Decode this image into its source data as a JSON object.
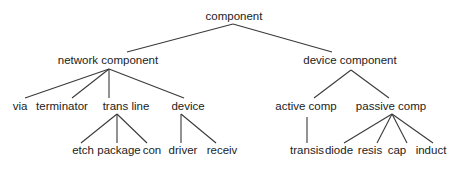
{
  "diagram": {
    "type": "tree",
    "root": "component",
    "nodes": [
      {
        "id": "component",
        "label": "component",
        "x": 234,
        "y": 20
      },
      {
        "id": "network_component",
        "label": "network component",
        "x": 108,
        "y": 64,
        "parent": "component"
      },
      {
        "id": "device_component",
        "label": "device component",
        "x": 350,
        "y": 64,
        "parent": "component"
      },
      {
        "id": "via",
        "label": "via",
        "x": 20,
        "y": 110,
        "parent": "network_component"
      },
      {
        "id": "terminator",
        "label": "terminator",
        "x": 62,
        "y": 110,
        "parent": "network_component"
      },
      {
        "id": "trans_line",
        "label": "trans line",
        "x": 126,
        "y": 110,
        "parent": "network_component"
      },
      {
        "id": "device",
        "label": "device",
        "x": 188,
        "y": 110,
        "parent": "network_component"
      },
      {
        "id": "etch",
        "label": "etch",
        "x": 83,
        "y": 154,
        "parent": "trans_line"
      },
      {
        "id": "package",
        "label": "package",
        "x": 119,
        "y": 154,
        "parent": "trans_line"
      },
      {
        "id": "con",
        "label": "con",
        "x": 152,
        "y": 154,
        "parent": "trans_line"
      },
      {
        "id": "driver",
        "label": "driver",
        "x": 183,
        "y": 154,
        "parent": "device"
      },
      {
        "id": "receiv",
        "label": "receiv",
        "x": 222,
        "y": 154,
        "parent": "device"
      },
      {
        "id": "active_comp",
        "label": "active comp",
        "x": 306,
        "y": 110,
        "parent": "device_component"
      },
      {
        "id": "passive_comp",
        "label": "passive comp",
        "x": 391,
        "y": 110,
        "parent": "device_component"
      },
      {
        "id": "transis",
        "label": "transis",
        "x": 307,
        "y": 154,
        "parent": "active_comp"
      },
      {
        "id": "diode",
        "label": "diode",
        "x": 339,
        "y": 154,
        "parent": "passive_comp"
      },
      {
        "id": "resis",
        "label": "resis",
        "x": 370,
        "y": 154,
        "parent": "passive_comp"
      },
      {
        "id": "cap",
        "label": "cap",
        "x": 397,
        "y": 154,
        "parent": "passive_comp"
      },
      {
        "id": "induct",
        "label": "induct",
        "x": 431,
        "y": 154,
        "parent": "passive_comp"
      }
    ],
    "edges": [
      {
        "from": "component",
        "to": "network_component",
        "x1": 233,
        "y1": 24,
        "x2": 127,
        "y2": 52
      },
      {
        "from": "component",
        "to": "device_component",
        "x1": 233,
        "y1": 24,
        "x2": 332,
        "y2": 52
      },
      {
        "from": "network_component",
        "to": "via",
        "x1": 109,
        "y1": 69,
        "x2": 25,
        "y2": 98
      },
      {
        "from": "network_component",
        "to": "terminator",
        "x1": 109,
        "y1": 69,
        "x2": 72,
        "y2": 98
      },
      {
        "from": "network_component",
        "to": "trans_line",
        "x1": 109,
        "y1": 69,
        "x2": 109,
        "y2": 98
      },
      {
        "from": "network_component",
        "to": "device",
        "x1": 109,
        "y1": 69,
        "x2": 184,
        "y2": 98
      },
      {
        "from": "trans_line",
        "to": "etch",
        "x1": 117,
        "y1": 114,
        "x2": 81,
        "y2": 143
      },
      {
        "from": "trans_line",
        "to": "package",
        "x1": 117,
        "y1": 114,
        "x2": 117,
        "y2": 143
      },
      {
        "from": "trans_line",
        "to": "con",
        "x1": 117,
        "y1": 114,
        "x2": 147,
        "y2": 143
      },
      {
        "from": "device",
        "to": "driver",
        "x1": 181,
        "y1": 114,
        "x2": 181,
        "y2": 143
      },
      {
        "from": "device",
        "to": "receiv",
        "x1": 181,
        "y1": 114,
        "x2": 216,
        "y2": 143
      },
      {
        "from": "device_component",
        "to": "active_comp",
        "x1": 351,
        "y1": 70,
        "x2": 314,
        "y2": 98
      },
      {
        "from": "device_component",
        "to": "passive_comp",
        "x1": 351,
        "y1": 70,
        "x2": 389,
        "y2": 98
      },
      {
        "from": "active_comp",
        "to": "transis",
        "x1": 307,
        "y1": 117,
        "x2": 307,
        "y2": 143
      },
      {
        "from": "passive_comp",
        "to": "diode",
        "x1": 392,
        "y1": 114,
        "x2": 344,
        "y2": 143
      },
      {
        "from": "passive_comp",
        "to": "resis",
        "x1": 392,
        "y1": 114,
        "x2": 377,
        "y2": 143
      },
      {
        "from": "passive_comp",
        "to": "cap",
        "x1": 392,
        "y1": 114,
        "x2": 407,
        "y2": 143
      },
      {
        "from": "passive_comp",
        "to": "induct",
        "x1": 392,
        "y1": 114,
        "x2": 433,
        "y2": 143
      }
    ]
  }
}
